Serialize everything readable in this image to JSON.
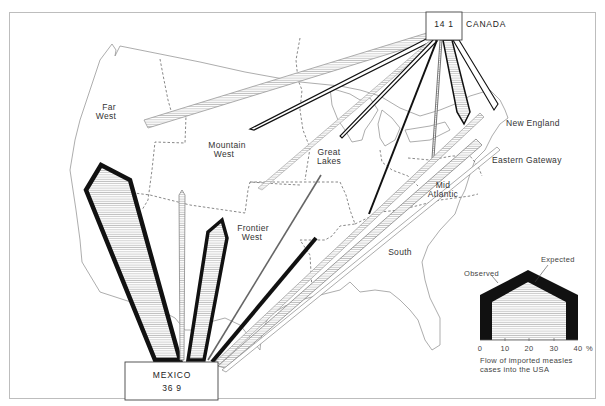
{
  "origins": {
    "canada": {
      "name": "CANADA",
      "value": "14 1"
    },
    "mexico": {
      "name": "MEXICO",
      "value": "36 9"
    }
  },
  "regions": [
    {
      "name": "Far West",
      "line1": "Far",
      "line2": "West"
    },
    {
      "name": "Mountain West",
      "line1": "Mountain",
      "line2": "West"
    },
    {
      "name": "Great Lakes",
      "line1": "Great",
      "line2": "Lakes"
    },
    {
      "name": "Frontier West",
      "line1": "Frontier",
      "line2": "West"
    },
    {
      "name": "Mid Atlantic",
      "line1": "Mid",
      "line2": "Atlantic"
    },
    {
      "name": "South",
      "line1": "South",
      "line2": ""
    },
    {
      "name": "New England",
      "line1": "New England",
      "line2": ""
    },
    {
      "name": "Eastern Gateway",
      "line1": "Eastern Gateway",
      "line2": ""
    }
  ],
  "legend": {
    "observed_label": "Observed",
    "expected_label": "Expected",
    "axis_ticks": [
      "0",
      "10",
      "20",
      "30",
      "40"
    ],
    "axis_unit": "%",
    "caption_line1": "Flow of imported measles",
    "caption_line2": "cases into the USA"
  },
  "colors": {
    "ink": "#111111",
    "coast": "#8a8a8a",
    "frame": "#bdbdbd",
    "hatch": "#9a9a9a"
  }
}
